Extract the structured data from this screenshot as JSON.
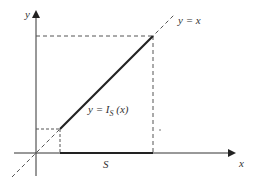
{
  "diagram": {
    "axes": {
      "x_label": "x",
      "y_label": "y"
    },
    "identity_line_label": "y = x",
    "function_label": {
      "prefix": "y = I",
      "subscript": "S",
      "suffix": " (x)"
    },
    "set_label": "S",
    "colors": {
      "axis": "#333333",
      "thick_line": "#222222",
      "dashed": "#555555"
    }
  }
}
